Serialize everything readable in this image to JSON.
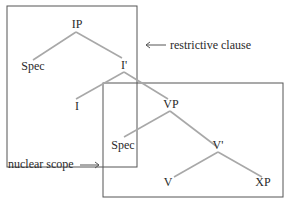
{
  "diagram": {
    "type": "syntax-tree",
    "nodes": {
      "ip": "IP",
      "spec_top": "Spec",
      "i_bar": "I'",
      "i": "I",
      "vp": "VP",
      "spec_bottom": "Spec",
      "v_bar": "V'",
      "v": "V",
      "xp": "XP"
    },
    "edges": [
      [
        "IP",
        "Spec"
      ],
      [
        "IP",
        "I'"
      ],
      [
        "I'",
        "I"
      ],
      [
        "I'",
        "VP"
      ],
      [
        "VP",
        "Spec"
      ],
      [
        "VP",
        "V'"
      ],
      [
        "V'",
        "V"
      ],
      [
        "V'",
        "XP"
      ]
    ],
    "annotations": {
      "restrictive": "restrictive clause",
      "nuclear": "nuclear scope"
    },
    "colors": {
      "box": "#555555",
      "edge": "#a8a8a8",
      "text": "#2a2a2a"
    }
  }
}
